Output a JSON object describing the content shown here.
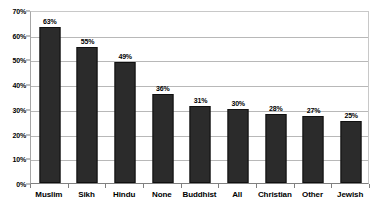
{
  "chart_data": {
    "type": "bar",
    "title": "",
    "subtitle": "",
    "xlabel": "",
    "ylabel": "",
    "categories": [
      "Muslim",
      "Sikh",
      "Hindu",
      "None",
      "Buddhist",
      "All",
      "Christian",
      "Other",
      "Jewish"
    ],
    "values": [
      63,
      55,
      49,
      36,
      31,
      30,
      28,
      27,
      25
    ],
    "value_labels": [
      "63%",
      "55%",
      "49%",
      "36%",
      "31%",
      "30%",
      "28%",
      "27%",
      "25%"
    ],
    "ylim": [
      0,
      70
    ],
    "ytick_values": [
      0,
      10,
      20,
      30,
      40,
      50,
      60,
      70
    ],
    "ytick_labels": [
      "0%",
      "10%",
      "20%",
      "30%",
      "40%",
      "50%",
      "60%",
      "70%"
    ],
    "grid": true,
    "grid_axis": "y",
    "legend": false,
    "legend_position": "none",
    "series": [
      {
        "name": "",
        "values": [
          63,
          55,
          49,
          36,
          31,
          30,
          28,
          27,
          25
        ],
        "color": "#2b2b2b"
      }
    ],
    "colors": {
      "bar_fill": "#2b2b2b",
      "bar_border": "#101010",
      "gridline": "#b8b8b8",
      "axis": "#808080",
      "plot_background": "#ffffff",
      "text": "#000000"
    }
  }
}
